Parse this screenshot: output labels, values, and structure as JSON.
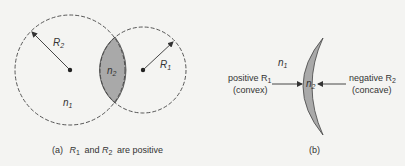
{
  "panel_a": {
    "caption_prefix": "(a)",
    "caption_r1": "R",
    "caption_r1_sub": "1",
    "caption_and": "and",
    "caption_r2": "R",
    "caption_r2_sub": "2",
    "caption_suffix": "are positive",
    "big_circle_radius_label": "R",
    "big_circle_radius_sub": "2",
    "small_circle_radius_label": "R",
    "small_circle_radius_sub": "1",
    "lens_index_label": "n",
    "lens_index_sub": "2",
    "outer_index_label": "n",
    "outer_index_sub": "1"
  },
  "panel_b": {
    "caption": "(b)",
    "outer_index_label": "n",
    "outer_index_sub": "1",
    "lens_index_label": "n",
    "lens_index_sub": "2",
    "left_label_line1": "positive R",
    "left_label_sub": "1",
    "left_label_line2": "(convex)",
    "right_label_line1": "negative R",
    "right_label_sub": "2",
    "right_label_line2": "(concave)"
  },
  "colors": {
    "background": "#f4f4f2",
    "lens_fill": "#a9a9a9",
    "stroke": "#333333"
  }
}
